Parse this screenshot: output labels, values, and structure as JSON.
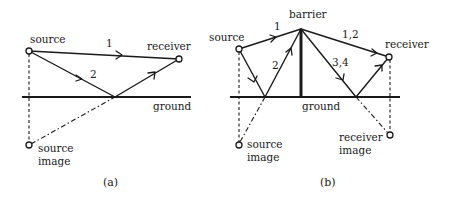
{
  "figure": {
    "panel_a": {
      "caption": "(a)",
      "labels": {
        "source": "source",
        "receiver": "receiver",
        "ground": "ground",
        "source_image_line1": "source",
        "source_image_line2": "image"
      },
      "paths": [
        {
          "id": "1",
          "label": "1",
          "description": "direct path source to receiver"
        },
        {
          "id": "2",
          "label": "2",
          "description": "ground-reflected path via reflection point"
        }
      ]
    },
    "panel_b": {
      "caption": "(b)",
      "labels": {
        "barrier": "barrier",
        "source": "source",
        "receiver": "receiver",
        "ground": "ground",
        "source_image_line1": "source",
        "source_image_line2": "image",
        "receiver_image_line1": "receiver",
        "receiver_image_line2": "image"
      },
      "paths": [
        {
          "id": "1",
          "label": "1",
          "description": "source to barrier top directly"
        },
        {
          "id": "2",
          "label": "2",
          "description": "source to barrier top via ground reflection"
        },
        {
          "id": "12",
          "label": "1,2",
          "description": "barrier top to receiver directly"
        },
        {
          "id": "34",
          "label": "3,4",
          "description": "barrier top to receiver via ground reflection"
        }
      ]
    }
  }
}
